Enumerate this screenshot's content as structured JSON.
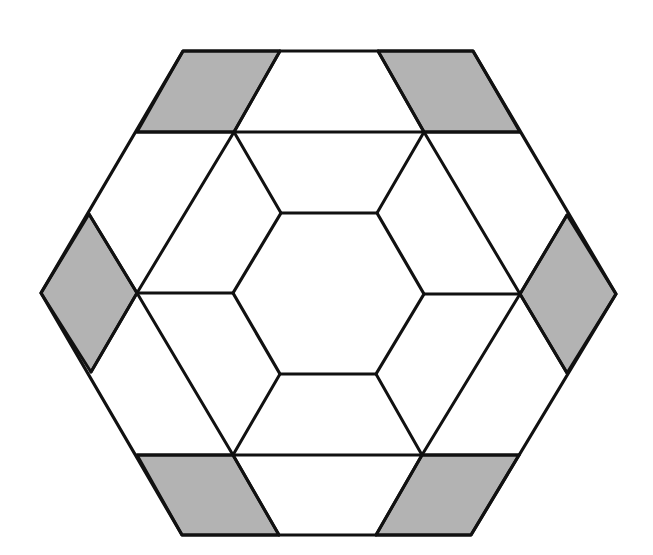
{
  "diagram": {
    "colors": {
      "background": "#ffffff",
      "stroke": "#111111",
      "shade": "#b3b3b3"
    },
    "outer_hexagon": [
      [
        183,
        51
      ],
      [
        473,
        51
      ],
      [
        616,
        294
      ],
      [
        471,
        535
      ],
      [
        182,
        535
      ],
      [
        41,
        293
      ]
    ],
    "inner_hexagon": [
      [
        281,
        213
      ],
      [
        377,
        213
      ],
      [
        424,
        294
      ],
      [
        376,
        374
      ],
      [
        280,
        374
      ],
      [
        233,
        293
      ]
    ],
    "shaded_regions": [
      {
        "name": "top-left",
        "points": [
          [
            183,
            51
          ],
          [
            280,
            51
          ],
          [
            234,
            132
          ],
          [
            137,
            132
          ]
        ]
      },
      {
        "name": "top-right",
        "points": [
          [
            378,
            51
          ],
          [
            473,
            51
          ],
          [
            520,
            132
          ],
          [
            424,
            132
          ]
        ]
      },
      {
        "name": "left",
        "points": [
          [
            89,
            214
          ],
          [
            137,
            293
          ],
          [
            91,
            372
          ],
          [
            41,
            293
          ]
        ]
      },
      {
        "name": "right",
        "points": [
          [
            567,
            215
          ],
          [
            616,
            294
          ],
          [
            567,
            373
          ],
          [
            520,
            294
          ]
        ]
      },
      {
        "name": "bottom-left",
        "points": [
          [
            137,
            455
          ],
          [
            233,
            455
          ],
          [
            279,
            535
          ],
          [
            182,
            535
          ]
        ]
      },
      {
        "name": "bottom-right",
        "points": [
          [
            422,
            455
          ],
          [
            519,
            455
          ],
          [
            471,
            535
          ],
          [
            376,
            535
          ]
        ]
      }
    ],
    "segments": [
      [
        [
          137,
          132
        ],
        [
          520,
          132
        ]
      ],
      [
        [
          137,
          455
        ],
        [
          519,
          455
        ]
      ],
      [
        [
          280,
          51
        ],
        [
          234,
          132
        ]
      ],
      [
        [
          378,
          51
        ],
        [
          424,
          132
        ]
      ],
      [
        [
          279,
          535
        ],
        [
          233,
          455
        ]
      ],
      [
        [
          376,
          535
        ],
        [
          422,
          455
        ]
      ],
      [
        [
          234,
          132
        ],
        [
          281,
          213
        ]
      ],
      [
        [
          424,
          132
        ],
        [
          377,
          213
        ]
      ],
      [
        [
          234,
          132
        ],
        [
          137,
          293
        ]
      ],
      [
        [
          424,
          132
        ],
        [
          520,
          294
        ]
      ],
      [
        [
          137,
          293
        ],
        [
          233,
          455
        ]
      ],
      [
        [
          520,
          294
        ],
        [
          422,
          455
        ]
      ],
      [
        [
          280,
          374
        ],
        [
          233,
          455
        ]
      ],
      [
        [
          376,
          374
        ],
        [
          422,
          455
        ]
      ],
      [
        [
          137,
          293
        ],
        [
          233,
          293
        ]
      ],
      [
        [
          424,
          294
        ],
        [
          520,
          294
        ]
      ],
      [
        [
          89,
          214
        ],
        [
          137,
          293
        ]
      ],
      [
        [
          137,
          293
        ],
        [
          91,
          372
        ]
      ],
      [
        [
          567,
          215
        ],
        [
          520,
          294
        ]
      ],
      [
        [
          520,
          294
        ],
        [
          567,
          373
        ]
      ]
    ]
  }
}
